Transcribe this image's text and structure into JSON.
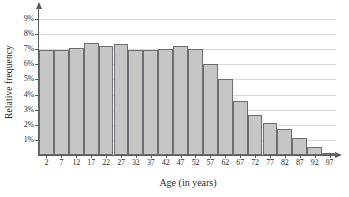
{
  "chart_data": {
    "type": "bar",
    "title": "",
    "xlabel": "Age (in years)",
    "ylabel": "Relative frequency",
    "categories": [
      "2",
      "7",
      "12",
      "17",
      "22",
      "27",
      "32",
      "37",
      "42",
      "47",
      "52",
      "57",
      "62",
      "67",
      "72",
      "77",
      "82",
      "87",
      "92",
      "97"
    ],
    "values": [
      6.95,
      6.95,
      7.1,
      7.4,
      7.25,
      7.35,
      6.95,
      6.95,
      7.05,
      7.25,
      7.0,
      6.05,
      5.05,
      3.6,
      2.65,
      2.15,
      1.7,
      1.1,
      0.5,
      0.15
    ],
    "ylim": [
      0,
      9.6
    ],
    "ytick_values": [
      1,
      2,
      3,
      4,
      5,
      6,
      7,
      8,
      9
    ],
    "ytick_labels": [
      "1%",
      "2%",
      "3%",
      "4%",
      "5%",
      "6%",
      "7%",
      "8%",
      "9%"
    ],
    "grid": true,
    "legend": false,
    "bar_fill_color": "#c6c6c6",
    "bar_edge_color": "#6d6e71",
    "gridline_color": "#d9d9d9",
    "axis_color": "#58595b"
  }
}
